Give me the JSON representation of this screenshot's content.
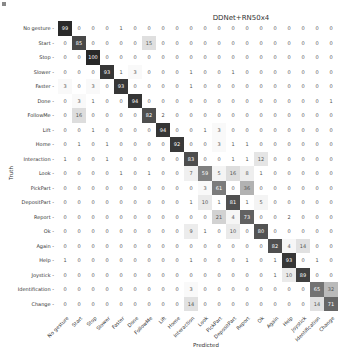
{
  "chart_data": {
    "type": "heatmap",
    "title": "DDNet+RN50x4",
    "xlabel": "Predicted",
    "ylabel": "Truth",
    "labels": [
      "No gesture",
      "Start",
      "Stop",
      "Slower",
      "Faster",
      "Done",
      "FollowMe",
      "Lift",
      "Home",
      "Interaction",
      "Look",
      "PickPart",
      "DepositPart",
      "Report",
      "Ok",
      "Again",
      "Help",
      "Joystick",
      "Identification",
      "Change"
    ],
    "matrix": [
      [
        99,
        0,
        0,
        0,
        1,
        0,
        0,
        0,
        0,
        0,
        0,
        0,
        0,
        0,
        0,
        0,
        0,
        0,
        0,
        0
      ],
      [
        0,
        85,
        0,
        0,
        0,
        0,
        15,
        0,
        0,
        0,
        0,
        0,
        0,
        0,
        0,
        0,
        0,
        0,
        0,
        0
      ],
      [
        0,
        0,
        100,
        0,
        0,
        0,
        0,
        0,
        0,
        0,
        0,
        0,
        0,
        0,
        0,
        0,
        0,
        0,
        0,
        0
      ],
      [
        0,
        0,
        0,
        93,
        1,
        3,
        0,
        0,
        0,
        1,
        0,
        0,
        1,
        0,
        0,
        0,
        0,
        0,
        0,
        0
      ],
      [
        3,
        0,
        3,
        0,
        93,
        0,
        0,
        0,
        0,
        1,
        0,
        0,
        0,
        0,
        0,
        0,
        0,
        0,
        0,
        0
      ],
      [
        0,
        3,
        1,
        0,
        0,
        94,
        0,
        0,
        0,
        0,
        0,
        0,
        0,
        0,
        0,
        0,
        0,
        0,
        0,
        1
      ],
      [
        0,
        16,
        0,
        0,
        0,
        0,
        82,
        2,
        0,
        0,
        0,
        0,
        0,
        0,
        0,
        0,
        0,
        0,
        0,
        0
      ],
      [
        0,
        0,
        1,
        0,
        0,
        0,
        0,
        94,
        0,
        0,
        1,
        3,
        0,
        0,
        0,
        0,
        0,
        0,
        0,
        0
      ],
      [
        0,
        1,
        0,
        1,
        0,
        0,
        0,
        0,
        92,
        0,
        0,
        3,
        1,
        1,
        0,
        0,
        0,
        0,
        0,
        0
      ],
      [
        1,
        0,
        0,
        1,
        0,
        0,
        0,
        0,
        0,
        83,
        0,
        0,
        1,
        1,
        12,
        0,
        0,
        0,
        0,
        0
      ],
      [
        0,
        0,
        0,
        0,
        1,
        0,
        1,
        0,
        0,
        7,
        59,
        5,
        16,
        8,
        1,
        0,
        0,
        0,
        0,
        0
      ],
      [
        0,
        0,
        0,
        0,
        0,
        0,
        0,
        0,
        0,
        0,
        3,
        61,
        0,
        36,
        0,
        0,
        0,
        0,
        0,
        0
      ],
      [
        0,
        0,
        0,
        0,
        0,
        0,
        0,
        0,
        0,
        1,
        10,
        1,
        81,
        1,
        5,
        0,
        0,
        0,
        0,
        0
      ],
      [
        0,
        0,
        0,
        0,
        0,
        0,
        0,
        0,
        0,
        0,
        0,
        21,
        4,
        73,
        0,
        0,
        2,
        0,
        0,
        0
      ],
      [
        0,
        0,
        0,
        0,
        0,
        0,
        0,
        0,
        0,
        9,
        1,
        0,
        10,
        0,
        80,
        0,
        0,
        0,
        0,
        0
      ],
      [
        0,
        0,
        0,
        0,
        0,
        0,
        0,
        0,
        0,
        0,
        0,
        0,
        0,
        0,
        0,
        82,
        4,
        14,
        0,
        0
      ],
      [
        1,
        0,
        0,
        0,
        0,
        0,
        0,
        0,
        0,
        1,
        0,
        0,
        0,
        1,
        0,
        1,
        93,
        0,
        1,
        0
      ],
      [
        0,
        0,
        0,
        0,
        0,
        0,
        0,
        0,
        0,
        0,
        0,
        0,
        0,
        0,
        0,
        1,
        10,
        89,
        0,
        0
      ],
      [
        0,
        0,
        0,
        0,
        0,
        0,
        0,
        0,
        0,
        3,
        0,
        0,
        0,
        0,
        0,
        0,
        0,
        0,
        65,
        32
      ],
      [
        0,
        0,
        0,
        0,
        0,
        0,
        0,
        0,
        0,
        14,
        0,
        0,
        0,
        0,
        0,
        0,
        0,
        0,
        14,
        71
      ]
    ],
    "colormap": "greys",
    "vmin": 0,
    "vmax": 100,
    "grid": false,
    "legend": "none"
  }
}
